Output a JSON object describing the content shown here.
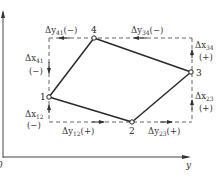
{
  "diagram": {
    "type": "coordinate-increment traverse diagram",
    "axes": {
      "vertical_label": "",
      "horizontal_label": "y",
      "origin_label": "0"
    },
    "nodes": [
      {
        "id": "1",
        "label": "1"
      },
      {
        "id": "2",
        "label": "2"
      },
      {
        "id": "3",
        "label": "3"
      },
      {
        "id": "4",
        "label": "4"
      }
    ],
    "edges": [
      {
        "from": "1",
        "to": "2"
      },
      {
        "from": "2",
        "to": "3"
      },
      {
        "from": "3",
        "to": "4"
      },
      {
        "from": "4",
        "to": "1"
      }
    ],
    "increments": {
      "dy41": {
        "delta": "Δy",
        "sub": "41",
        "sign": "(−)"
      },
      "dy34": {
        "delta": "Δy",
        "sub": "34",
        "sign": "(−)"
      },
      "dx34": {
        "delta": "Δx",
        "sub": "34",
        "sign": "(+)"
      },
      "dx41": {
        "delta": "Δx",
        "sub": "41",
        "sign": "(−)"
      },
      "dx23": {
        "delta": "Δx",
        "sub": "23",
        "sign": "(+)"
      },
      "dx12": {
        "delta": "Δx",
        "sub": "12",
        "sign": "(−)"
      },
      "dy12": {
        "delta": "Δy",
        "sub": "12",
        "sign": "(+)"
      },
      "dy23": {
        "delta": "Δy",
        "sub": "23",
        "sign": "(+)"
      }
    },
    "colors": {
      "line": "#2a2a2a",
      "dashed": "#555555",
      "text": "#333333"
    }
  }
}
